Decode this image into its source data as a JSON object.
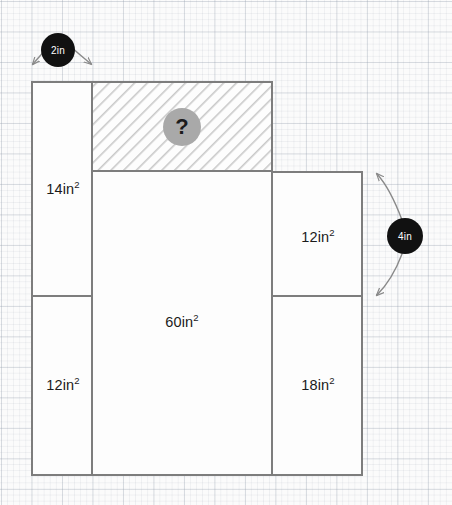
{
  "figure": {
    "type": "composite-rectangle-area-diagram",
    "units": "in",
    "background": {
      "grid": "graph-paper",
      "minor_spacing_px": 6,
      "major_spacing_px": 30,
      "paper_color": "#fbfbfb",
      "grid_color": "#96a0af"
    },
    "stroke_color": "#7d7d7d",
    "stroke_width": 2,
    "regions": [
      {
        "name": "top-left-region",
        "label": "14in",
        "exponent": "2",
        "value": 14,
        "label_x": 63,
        "label_y": 189,
        "x": 32,
        "y": 82,
        "w": 60,
        "h": 214,
        "hatched": false
      },
      {
        "name": "unknown-region",
        "label": "?",
        "exponent": "",
        "value": null,
        "label_x": 182,
        "label_y": 127,
        "x": 92,
        "y": 82,
        "w": 180,
        "h": 89,
        "hatched": true
      },
      {
        "name": "center-region",
        "label": "60in",
        "exponent": "2",
        "value": 60,
        "label_x": 182,
        "label_y": 322,
        "x": 92,
        "y": 171,
        "w": 180,
        "h": 304,
        "hatched": false
      },
      {
        "name": "right-upper-region",
        "label": "12in",
        "exponent": "2",
        "value": 12,
        "label_x": 318,
        "label_y": 237,
        "x": 272,
        "y": 172,
        "w": 90,
        "h": 124,
        "hatched": false
      },
      {
        "name": "bottom-left-region",
        "label": "12in",
        "exponent": "2",
        "value": 12,
        "label_x": 63,
        "label_y": 385,
        "x": 32,
        "y": 296,
        "w": 60,
        "h": 179,
        "hatched": false
      },
      {
        "name": "right-lower-region",
        "label": "18in",
        "exponent": "2",
        "value": 18,
        "label_x": 318,
        "label_y": 385,
        "x": 272,
        "y": 296,
        "w": 90,
        "h": 179,
        "hatched": false
      }
    ],
    "callouts": [
      {
        "name": "top-width-callout",
        "label": "2in",
        "value": 2,
        "badge_x": 58,
        "badge_y": 50,
        "orientation": "horizontal",
        "badge_color": "#111111",
        "text_color": "#ffffff"
      },
      {
        "name": "right-height-callout",
        "label": "4in",
        "value": 4,
        "badge_x": 405,
        "badge_y": 236,
        "orientation": "vertical",
        "badge_color": "#111111",
        "text_color": "#ffffff"
      }
    ],
    "unknown_marker": {
      "name": "question-mark-marker",
      "glyph": "?",
      "x": 182,
      "y": 127,
      "circle_color": "#a9a9a9",
      "glyph_color": "#1b1b1b"
    }
  }
}
